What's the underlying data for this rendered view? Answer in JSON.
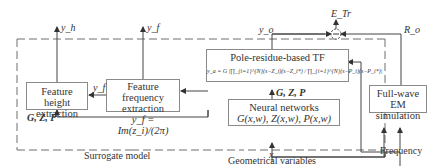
{
  "diagram": {
    "surrogate_region_label": "Surrogate model",
    "boxes": {
      "feature_height": {
        "line1": "Feature height",
        "line2": "extraction"
      },
      "feature_frequency": {
        "line1": "Feature frequency",
        "line2": "extraction",
        "formula": "y_f = Im(z_i)/(2π)"
      },
      "pole_residue": {
        "title": "Pole-residue-based TF",
        "formula": "y_a = G |∏_{i=1}^{N}(s−Z_i)(s−Z_i*) / ∏_{i=1}^{N}(s−P_i)(s−P_i*)|"
      },
      "neural_networks": {
        "line1": "Neural networks",
        "line2": "G(x,w), Z(x,w), P(x,w)"
      },
      "full_wave_em": {
        "line1": "Full-wave EM",
        "line2": "simulation"
      }
    },
    "signals": {
      "y_h": "y_h",
      "y_f_top": "y_f",
      "y_f_mid": "y_f",
      "y_o": "y_o",
      "E_Tr": "E_Tr",
      "R_o": "R_o",
      "gzp_left": "G, Z, P",
      "gzp_mid": "G, Z, P",
      "x": "x",
      "geometrical_variables": "Geometrical variables",
      "frequency": "Frequency",
      "summing_sign": "−"
    },
    "colors": {
      "line": "#444444",
      "box_border": "#8a8a8a",
      "dashed_border": "#6f6f6f"
    }
  }
}
